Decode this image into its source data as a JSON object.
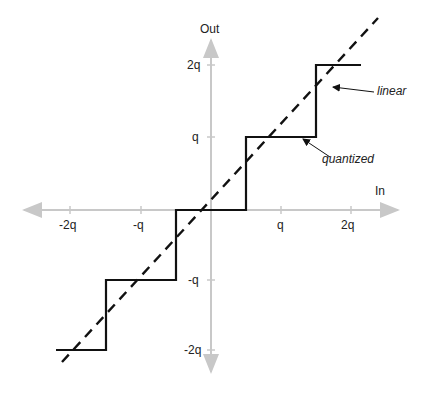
{
  "diagram": {
    "axes": {
      "x_label": "In",
      "y_label": "Out",
      "x_ticks": [
        "-2q",
        "-q",
        "q",
        "2q"
      ],
      "y_ticks": [
        "2q",
        "q",
        "-q",
        "-2q"
      ]
    },
    "curves": {
      "linear_label": "linear",
      "quantized_label": "quantized"
    },
    "colors": {
      "axis": "#c8c8c8",
      "curve": "#111111",
      "text": "#222222"
    }
  }
}
